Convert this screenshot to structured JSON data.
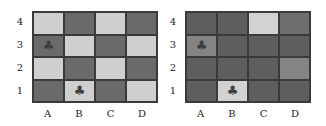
{
  "panels": [
    {
      "name": "left",
      "row_labels": [
        "4",
        "3",
        "2",
        "1"
      ],
      "col_labels": [
        "A",
        "B",
        "C",
        "D"
      ],
      "cells": [
        [
          {
            "color": "#cfcfcf"
          },
          {
            "color": "#6a6a6a"
          },
          {
            "color": "#cfcfcf"
          },
          {
            "color": "#6a6a6a"
          }
        ],
        [
          {
            "color": "#6a6a6a",
            "icon": "♣"
          },
          {
            "color": "#cfcfcf"
          },
          {
            "color": "#6a6a6a"
          },
          {
            "color": "#cfcfcf"
          }
        ],
        [
          {
            "color": "#cfcfcf"
          },
          {
            "color": "#6a6a6a"
          },
          {
            "color": "#cfcfcf"
          },
          {
            "color": "#6a6a6a"
          }
        ],
        [
          {
            "color": "#6a6a6a"
          },
          {
            "color": "#cfcfcf",
            "icon": "♣"
          },
          {
            "color": "#6a6a6a"
          },
          {
            "color": "#cfcfcf"
          }
        ]
      ]
    },
    {
      "name": "right",
      "row_labels": [
        "4",
        "3",
        "2",
        "1"
      ],
      "col_labels": [
        "A",
        "B",
        "C",
        "D"
      ],
      "cells": [
        [
          {
            "color": "#5e5e5e"
          },
          {
            "color": "#5e5e5e"
          },
          {
            "color": "#d2d2d2"
          },
          {
            "color": "#6e6e6e"
          }
        ],
        [
          {
            "color": "#848484",
            "icon": "♣"
          },
          {
            "color": "#5e5e5e"
          },
          {
            "color": "#5e5e5e"
          },
          {
            "color": "#5e5e5e"
          }
        ],
        [
          {
            "color": "#5e5e5e"
          },
          {
            "color": "#5e5e5e"
          },
          {
            "color": "#5e5e5e"
          },
          {
            "color": "#848484"
          }
        ],
        [
          {
            "color": "#5e5e5e"
          },
          {
            "color": "#d2d2d2",
            "icon": "♣"
          },
          {
            "color": "#5e5e5e"
          },
          {
            "color": "#5e5e5e"
          }
        ]
      ]
    }
  ]
}
